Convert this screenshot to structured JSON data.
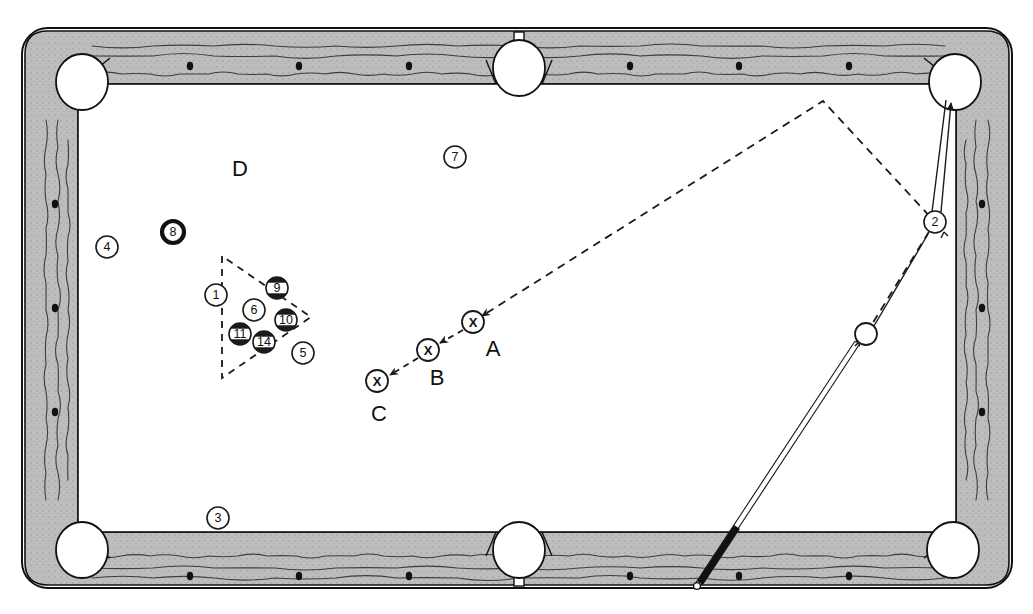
{
  "diagram": {
    "type": "billiards-table-diagram"
  },
  "colors": {
    "rail_fill": "#b9b9b9",
    "rail_stroke": "#111111",
    "cloth": "#ffffff",
    "ball_stroke": "#1a1a1a",
    "line": "#1a1a1a",
    "dash": "#1a1a1a",
    "cue_shaft": "#ffffff",
    "cue_wrap": "#111111"
  },
  "table": {
    "outer": {
      "x": 22,
      "y": 28,
      "w": 990,
      "h": 560,
      "radius": 26
    },
    "cloth": {
      "x": 78,
      "y": 84,
      "w": 878,
      "h": 448
    },
    "pockets": [
      {
        "name": "pocket-top-left",
        "cx": 82,
        "cy": 82,
        "r": 26,
        "kind": "corner"
      },
      {
        "name": "pocket-top-center",
        "cx": 519,
        "cy": 68,
        "r": 26,
        "kind": "side"
      },
      {
        "name": "pocket-top-right",
        "cx": 955,
        "cy": 82,
        "r": 26,
        "kind": "corner"
      },
      {
        "name": "pocket-bottom-left",
        "cx": 82,
        "cy": 550,
        "r": 26,
        "kind": "corner"
      },
      {
        "name": "pocket-bottom-center",
        "cx": 519,
        "cy": 550,
        "r": 26,
        "kind": "side"
      },
      {
        "name": "pocket-bottom-right",
        "cx": 953,
        "cy": 550,
        "r": 26,
        "kind": "corner"
      }
    ],
    "diamonds_top": [
      {
        "x": 190,
        "y": 66
      },
      {
        "x": 299,
        "y": 66
      },
      {
        "x": 409,
        "y": 66
      },
      {
        "x": 630,
        "y": 66
      },
      {
        "x": 739,
        "y": 66
      },
      {
        "x": 849,
        "y": 66
      }
    ],
    "diamonds_bottom": [
      {
        "x": 190,
        "y": 576
      },
      {
        "x": 299,
        "y": 576
      },
      {
        "x": 409,
        "y": 576
      },
      {
        "x": 630,
        "y": 576
      },
      {
        "x": 739,
        "y": 576
      },
      {
        "x": 849,
        "y": 576
      }
    ],
    "diamonds_left": [
      {
        "x": 55,
        "y": 204
      },
      {
        "x": 55,
        "y": 308
      },
      {
        "x": 55,
        "y": 412
      }
    ],
    "diamonds_right": [
      {
        "x": 982,
        "y": 204
      },
      {
        "x": 982,
        "y": 308
      },
      {
        "x": 982,
        "y": 412
      }
    ]
  },
  "balls": [
    {
      "id": "ball-4",
      "label": "4",
      "cx": 107,
      "cy": 247,
      "r": 11,
      "style": "solid-thin"
    },
    {
      "id": "ball-8",
      "label": "8",
      "cx": 173,
      "cy": 232,
      "r": 11,
      "style": "eight"
    },
    {
      "id": "ball-7",
      "label": "7",
      "cx": 455,
      "cy": 157,
      "r": 11,
      "style": "solid-thin"
    },
    {
      "id": "ball-3",
      "label": "3",
      "cx": 218,
      "cy": 518,
      "r": 11,
      "style": "solid-thin"
    },
    {
      "id": "ball-1",
      "label": "1",
      "cx": 216,
      "cy": 295,
      "r": 11,
      "style": "solid-thin"
    },
    {
      "id": "ball-9",
      "label": "9",
      "cx": 277,
      "cy": 288,
      "r": 11,
      "style": "stripe"
    },
    {
      "id": "ball-6",
      "label": "6",
      "cx": 254,
      "cy": 310,
      "r": 11,
      "style": "solid-thin"
    },
    {
      "id": "ball-10",
      "label": "10",
      "cx": 286,
      "cy": 320,
      "r": 11,
      "style": "stripe"
    },
    {
      "id": "ball-11",
      "label": "11",
      "cx": 240,
      "cy": 334,
      "r": 11,
      "style": "stripe"
    },
    {
      "id": "ball-14",
      "label": "14",
      "cx": 264,
      "cy": 342,
      "r": 11,
      "style": "stripe"
    },
    {
      "id": "ball-5",
      "label": "5",
      "cx": 303,
      "cy": 353,
      "r": 11,
      "style": "solid-thin"
    },
    {
      "id": "ball-2",
      "label": "2",
      "cx": 935,
      "cy": 222,
      "r": 11,
      "style": "solid-thin"
    }
  ],
  "cue_ball": {
    "id": "cue-ball",
    "cx": 866,
    "cy": 334,
    "r": 11
  },
  "rack_triangle": {
    "points": "222,256 222,378 311,317"
  },
  "x_positions": [
    {
      "id": "x-position-a",
      "label": "A",
      "cx": 473,
      "cy": 322,
      "r": 11,
      "label_x": 493,
      "label_y": 356
    },
    {
      "id": "x-position-b",
      "label": "B",
      "cx": 428,
      "cy": 350,
      "r": 11,
      "label_x": 437,
      "label_y": 385
    },
    {
      "id": "x-position-c",
      "label": "C",
      "cx": 377,
      "cy": 381,
      "r": 11,
      "label_x": 379,
      "label_y": 421
    }
  ],
  "zone_labels": [
    {
      "id": "zone-label-d",
      "label": "D",
      "x": 240,
      "y": 176
    }
  ],
  "paths": {
    "bank_path": "866,334 935,222 823,101 482,316",
    "cue_to_two": "874,326 928,234",
    "two_to_pocket": "938,212 950,105",
    "a_to_b": "463,330 440,343",
    "b_to_c": "418,358 390,375"
  },
  "cue_stick": {
    "tip": {
      "x": 857,
      "y": 343
    },
    "butt": {
      "x": 697,
      "y": 586
    },
    "wrap_start": {
      "x": 737,
      "y": 527
    },
    "wrap_end": {
      "x": 700,
      "y": 583
    }
  }
}
